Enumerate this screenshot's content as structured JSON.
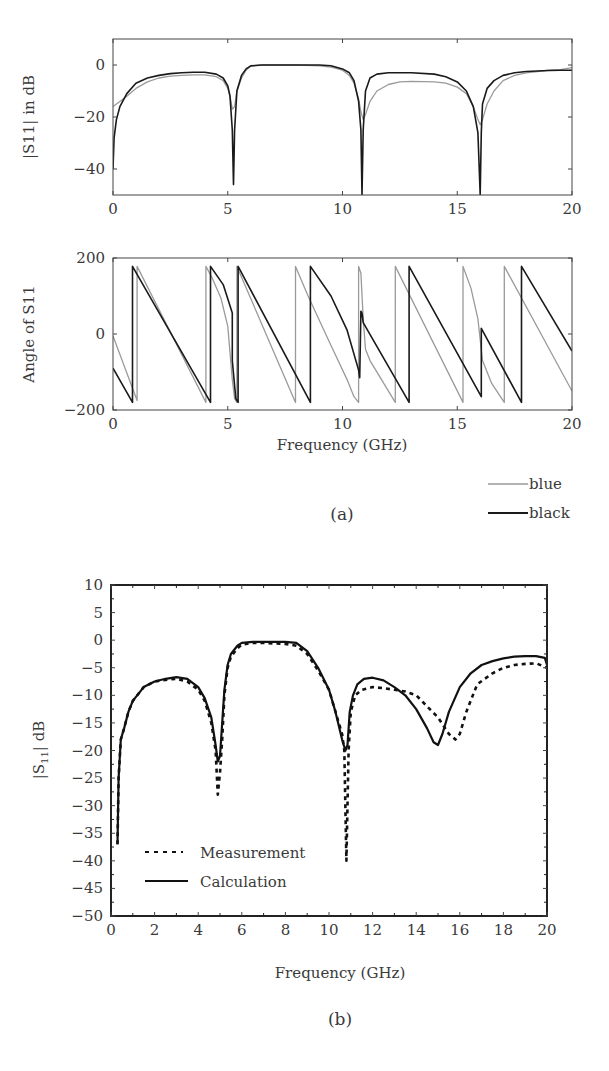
{
  "panel_a": {
    "caption": "(a)",
    "xlabel": "Frequency (GHz)",
    "legend": [
      {
        "label": "blue",
        "color": "#9a9a9a",
        "width": 1.2
      },
      {
        "label": "black",
        "color": "#1a1a1a",
        "width": 1.8
      }
    ]
  },
  "panel_b": {
    "caption": "(b)",
    "xlabel": "Frequency (GHz)",
    "ylabel": "|S11| dB",
    "legend": [
      {
        "label": "Measurement",
        "style": "dashed"
      },
      {
        "label": "Calculation",
        "style": "solid"
      }
    ]
  },
  "chart_data": [
    {
      "id": "a_top",
      "type": "line",
      "title": "",
      "xlabel": "",
      "ylabel": "|S11| in dB",
      "xlim": [
        0,
        20
      ],
      "ylim": [
        -50,
        10
      ],
      "xticks": [
        0,
        5,
        10,
        15,
        20
      ],
      "yticks": [
        0,
        -20,
        -40
      ],
      "grid": false,
      "frame": {
        "x0": 113,
        "x1": 572,
        "y0": 39,
        "y1": 195
      },
      "series": [
        {
          "name": "blue",
          "color": "#9a9a9a",
          "x": [
            0,
            0.3,
            0.6,
            1.0,
            1.5,
            2.0,
            2.5,
            3.0,
            3.5,
            4.0,
            4.5,
            4.8,
            5.0,
            5.1,
            5.2,
            5.3,
            5.4,
            5.6,
            5.8,
            6.0,
            6.5,
            7.0,
            8.0,
            9.0,
            9.5,
            10.0,
            10.3,
            10.5,
            10.7,
            10.8,
            10.9,
            11.0,
            11.2,
            11.5,
            12.0,
            12.5,
            13.0,
            14.0,
            14.5,
            15.0,
            15.4,
            15.7,
            15.9,
            16.0,
            16.1,
            16.3,
            16.6,
            17.0,
            17.5,
            18.0,
            18.5,
            19.0,
            19.5,
            20.0
          ],
          "y": [
            -16,
            -14,
            -12,
            -9,
            -6.5,
            -5,
            -4.3,
            -4,
            -3.8,
            -3.8,
            -4.5,
            -6,
            -9,
            -12,
            -17,
            -16,
            -10,
            -5,
            -2,
            -0.5,
            0,
            0,
            0,
            -0.3,
            -0.8,
            -2,
            -4,
            -7,
            -13,
            -18,
            -21,
            -19,
            -14,
            -10,
            -7.5,
            -6.5,
            -6.3,
            -6.5,
            -7,
            -8.5,
            -11,
            -16,
            -21,
            -23,
            -21,
            -15,
            -10,
            -6,
            -4,
            -3,
            -2.5,
            -2,
            -1.8,
            -1
          ]
        },
        {
          "name": "black",
          "color": "#1a1a1a",
          "x": [
            0,
            0.05,
            0.15,
            0.3,
            0.6,
            1.0,
            1.5,
            2.0,
            2.5,
            3.0,
            3.5,
            4.0,
            4.5,
            4.8,
            5.0,
            5.1,
            5.2,
            5.25,
            5.3,
            5.4,
            5.6,
            5.8,
            6.0,
            6.5,
            7.0,
            8.0,
            9.0,
            9.5,
            10.0,
            10.3,
            10.5,
            10.7,
            10.8,
            10.85,
            10.9,
            11.0,
            11.2,
            11.5,
            12.0,
            12.5,
            13.0,
            14.0,
            14.5,
            15.0,
            15.4,
            15.7,
            15.9,
            16.0,
            16.05,
            16.1,
            16.3,
            16.6,
            17.0,
            17.5,
            18.0,
            18.5,
            19.0,
            19.5,
            20.0
          ],
          "y": [
            -40,
            -28,
            -21,
            -16,
            -11,
            -7,
            -5,
            -4,
            -3.3,
            -3,
            -2.8,
            -2.8,
            -3.5,
            -5,
            -8,
            -12,
            -25,
            -46,
            -25,
            -10,
            -4,
            -1.5,
            -0.3,
            0,
            0,
            0,
            0,
            -0.3,
            -1.5,
            -3,
            -6,
            -14,
            -25,
            -50,
            -25,
            -10,
            -5,
            -3.5,
            -3,
            -3,
            -3,
            -3.5,
            -4.5,
            -6.5,
            -10,
            -16,
            -26,
            -50,
            -26,
            -15,
            -9,
            -6,
            -4,
            -3,
            -2.5,
            -2.3,
            -2.1,
            -2,
            -2
          ]
        }
      ]
    },
    {
      "id": "a_bottom",
      "type": "line",
      "title": "",
      "xlabel": "Frequency (GHz)",
      "ylabel": "Angle of S11",
      "xlim": [
        0,
        20
      ],
      "ylim": [
        -200,
        200
      ],
      "xticks": [
        0,
        5,
        10,
        15,
        20
      ],
      "yticks": [
        200,
        0,
        -200
      ],
      "grid": false,
      "frame": {
        "x0": 113,
        "x1": 572,
        "y0": 258,
        "y1": 410
      },
      "series": [
        {
          "name": "blue",
          "color": "#9a9a9a",
          "x": [
            0,
            1.05,
            1.05,
            4.05,
            4.05,
            4.3,
            4.7,
            5.0,
            5.2,
            5.3,
            5.4,
            5.4,
            7.95,
            7.95,
            8.5,
            9.5,
            10.2,
            10.5,
            10.7,
            10.7,
            10.8,
            10.9,
            11.0,
            11.2,
            12.3,
            12.3,
            15.25,
            15.25,
            15.6,
            15.9,
            16.1,
            16.5,
            17.05,
            17.05,
            20.0
          ],
          "y": [
            -5,
            -175,
            178,
            -180,
            178,
            150,
            95,
            20,
            -120,
            -170,
            -180,
            178,
            -180,
            178,
            100,
            -30,
            -120,
            -165,
            -180,
            178,
            160,
            40,
            -40,
            -70,
            -180,
            178,
            -180,
            178,
            120,
            40,
            -70,
            -130,
            -180,
            178,
            -150
          ]
        },
        {
          "name": "black",
          "color": "#1a1a1a",
          "x": [
            0,
            0.85,
            0.85,
            4.25,
            4.25,
            4.8,
            5.2,
            5.2,
            5.35,
            5.45,
            5.45,
            8.6,
            8.6,
            9.5,
            10.2,
            10.7,
            10.75,
            10.8,
            10.85,
            10.9,
            12.9,
            12.9,
            16.05,
            16.05,
            17.8,
            17.8,
            20.0
          ],
          "y": [
            -90,
            -180,
            178,
            -180,
            178,
            130,
            55,
            -70,
            -170,
            -180,
            178,
            -180,
            178,
            100,
            10,
            -95,
            -115,
            60,
            55,
            30,
            -180,
            178,
            -165,
            15,
            -180,
            178,
            -45
          ]
        }
      ]
    },
    {
      "id": "b",
      "type": "line",
      "title": "",
      "xlabel": "Frequency (GHz)",
      "ylabel": "|S11| dB",
      "xlim": [
        0,
        20
      ],
      "ylim": [
        -50,
        10
      ],
      "xticks": [
        0,
        2,
        4,
        6,
        8,
        10,
        12,
        14,
        16,
        18,
        20
      ],
      "yticks": [
        10,
        5,
        0,
        -5,
        -10,
        -15,
        -20,
        -25,
        -30,
        -35,
        -40,
        -45,
        -50
      ],
      "grid": false,
      "legend_position": "lower-left",
      "frame": {
        "x0": 111,
        "x1": 547,
        "y0": 585,
        "y1": 916
      },
      "series": [
        {
          "name": "Measurement",
          "style": "dashed",
          "x": [
            0.3,
            0.35,
            0.45,
            0.6,
            0.8,
            1.0,
            1.5,
            2.0,
            2.5,
            3.0,
            3.5,
            4.0,
            4.3,
            4.6,
            4.8,
            4.9,
            5.0,
            5.1,
            5.2,
            5.35,
            5.5,
            5.8,
            6.0,
            6.5,
            7.0,
            8.0,
            8.5,
            9.0,
            9.5,
            10.0,
            10.3,
            10.6,
            10.7,
            10.8,
            10.85,
            10.9,
            11.0,
            11.2,
            11.5,
            12.0,
            12.5,
            13.0,
            13.5,
            14.0,
            14.5,
            15.0,
            15.5,
            15.8,
            16.0,
            16.3,
            16.8,
            17.5,
            18.0,
            18.5,
            19.0,
            19.5,
            20.0
          ],
          "y": [
            -37,
            -25,
            -18,
            -16,
            -13,
            -11,
            -8.5,
            -7.5,
            -7.2,
            -7,
            -7.5,
            -9,
            -11,
            -15,
            -20,
            -28,
            -24,
            -18,
            -10,
            -5,
            -3,
            -1.5,
            -0.8,
            -0.5,
            -0.5,
            -0.7,
            -1,
            -2.5,
            -5.5,
            -9,
            -13,
            -17,
            -20,
            -40,
            -30,
            -20,
            -13,
            -10,
            -9,
            -8.5,
            -8.7,
            -9,
            -9.3,
            -10,
            -12,
            -14,
            -17,
            -18,
            -17,
            -13,
            -8,
            -6,
            -5,
            -4.5,
            -4.3,
            -4.2,
            -5
          ]
        },
        {
          "name": "Calculation",
          "style": "solid",
          "x": [
            0.3,
            0.35,
            0.45,
            0.6,
            0.8,
            1.0,
            1.5,
            2.0,
            2.5,
            3.0,
            3.5,
            4.0,
            4.3,
            4.6,
            4.8,
            4.9,
            5.0,
            5.1,
            5.2,
            5.35,
            5.5,
            5.8,
            6.0,
            6.5,
            7.0,
            8.0,
            8.5,
            9.0,
            9.5,
            10.0,
            10.3,
            10.6,
            10.75,
            10.85,
            10.95,
            11.1,
            11.3,
            11.6,
            12.0,
            12.5,
            13.0,
            13.5,
            14.0,
            14.5,
            14.8,
            15.0,
            15.2,
            15.5,
            16.0,
            16.5,
            17.0,
            17.5,
            18.0,
            18.5,
            19.0,
            19.5,
            19.9,
            20.0
          ],
          "y": [
            -37,
            -25,
            -18,
            -16,
            -13,
            -11,
            -8.5,
            -7.5,
            -7,
            -6.7,
            -7,
            -8.5,
            -10.5,
            -14,
            -19,
            -22,
            -21,
            -15,
            -9,
            -4.5,
            -2.5,
            -1,
            -0.5,
            -0.3,
            -0.3,
            -0.3,
            -0.5,
            -2,
            -5,
            -9,
            -13,
            -18,
            -20,
            -19,
            -13,
            -10,
            -8,
            -7,
            -6.8,
            -7.3,
            -8.5,
            -10,
            -12.5,
            -16,
            -18.5,
            -19,
            -17,
            -13,
            -8.5,
            -6,
            -4.5,
            -3.8,
            -3.3,
            -3,
            -2.9,
            -2.9,
            -3.2,
            -4.5
          ]
        }
      ]
    }
  ]
}
